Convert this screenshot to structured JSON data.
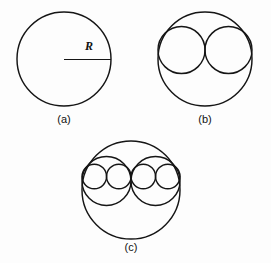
{
  "figure": {
    "background_color": "#fdfdfd",
    "stroke_color": "#151515",
    "panels": [
      {
        "id": "a",
        "caption": "(a)",
        "caption_x": 64,
        "caption_y": 123,
        "outer": {
          "cx": 64,
          "cy": 59,
          "r": 47
        },
        "annotation": {
          "label": "R",
          "label_x": 85,
          "label_y": 50,
          "line_x1": 64,
          "line_y1": 59.5,
          "line_x2": 111,
          "line_y2": 59.5
        },
        "medium_circles": [],
        "small_circles": []
      },
      {
        "id": "b",
        "caption": "(b)",
        "caption_x": 205,
        "caption_y": 123,
        "outer": {
          "cx": 205,
          "cy": 59,
          "r": 47
        },
        "medium_circles": [
          {
            "cx": 181.5,
            "cy": 50,
            "r": 23.5
          },
          {
            "cx": 228.5,
            "cy": 50,
            "r": 23.5
          }
        ],
        "small_circles": []
      },
      {
        "id": "c",
        "caption": "(c)",
        "caption_x": 131,
        "caption_y": 251,
        "outer": {
          "cx": 131,
          "cy": 190,
          "r": 49
        },
        "medium_circles": [
          {
            "cx": 106.5,
            "cy": 181,
            "r": 24.5
          },
          {
            "cx": 155.5,
            "cy": 181,
            "r": 24.5
          }
        ],
        "small_circles": [
          {
            "cx": 94.3,
            "cy": 176.5,
            "r": 12.25
          },
          {
            "cx": 118.8,
            "cy": 176.5,
            "r": 12.25
          },
          {
            "cx": 143.3,
            "cy": 176.5,
            "r": 12.25
          },
          {
            "cx": 167.8,
            "cy": 176.5,
            "r": 12.25
          }
        ]
      }
    ]
  }
}
